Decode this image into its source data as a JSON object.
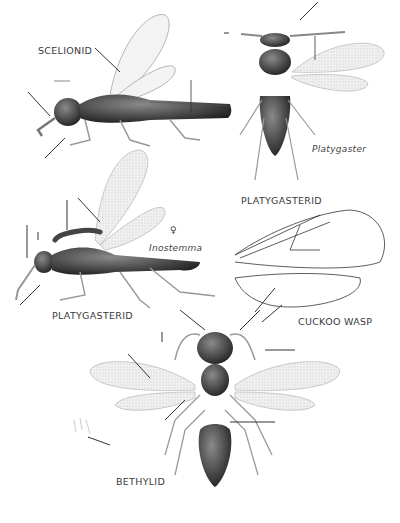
{
  "plate": {
    "labels": {
      "scelionid": "SCELIONID",
      "platygasterid_top": "PLATYGASTERID",
      "platygaster": "Platygaster",
      "inostemma": "Inostemma",
      "female_symbol": "♀",
      "platygasterid_left": "PLATYGASTERID",
      "cuckoo_wasp": "CUCKOO WASP",
      "bethylid": "BETHYLID"
    },
    "colors": {
      "ink": "#2a2a2a",
      "body_dark": "#2e2e2e",
      "body_mid": "#6a6a6a",
      "wing": "#ececec",
      "paper": "#ffffff"
    }
  }
}
